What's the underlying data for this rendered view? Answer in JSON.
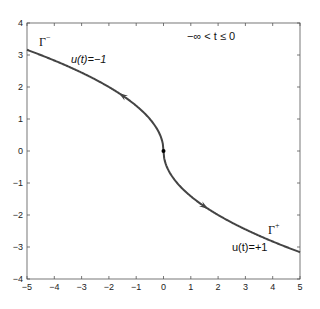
{
  "chart_data": {
    "type": "line",
    "title": "",
    "xlabel": "",
    "ylabel": "",
    "xlim": [
      -5,
      5
    ],
    "ylim": [
      -4,
      4
    ],
    "grid": false,
    "x_ticks": [
      "-5",
      "-4",
      "-3",
      "-2",
      "-1",
      "0",
      "1",
      "2",
      "3",
      "4",
      "5"
    ],
    "y_ticks": [
      "-4",
      "-3",
      "-2",
      "-1",
      "0",
      "1",
      "2",
      "3",
      "4"
    ],
    "series": [
      {
        "name": "Γ⁻ (u(t)=−1)",
        "x": [
          -5,
          -4,
          -3,
          -2,
          -1.5,
          -1,
          -0.5,
          -0.2,
          -0.05,
          0
        ],
        "y": [
          3.16,
          2.83,
          2.45,
          2.0,
          1.73,
          1.41,
          1.0,
          0.63,
          0.32,
          0
        ]
      },
      {
        "name": "Γ⁺ (u(t)=+1)",
        "x": [
          0,
          0.05,
          0.2,
          0.5,
          1,
          1.5,
          2,
          3,
          4,
          5
        ],
        "y": [
          0,
          -0.32,
          -0.63,
          -1.0,
          -1.41,
          -1.73,
          -2.0,
          -2.45,
          -2.83,
          -3.16
        ]
      }
    ],
    "markers": [
      {
        "type": "dot",
        "x": 0,
        "y": 0
      },
      {
        "type": "arrow",
        "x": -1.5,
        "y": 1.73,
        "direction": "up-left"
      },
      {
        "type": "arrow",
        "x": 1.5,
        "y": -1.73,
        "direction": "down-right"
      }
    ],
    "annotations": [
      {
        "text": "−∞ <  t ≤ 0",
        "x": 0.9,
        "y": 3.55
      },
      {
        "text": "Γ⁻",
        "x": -4.5,
        "y": 3.35
      },
      {
        "text": "u(t)=−1",
        "x": -2.7,
        "y": 2.75
      },
      {
        "text": "Γ⁺",
        "x": 3.9,
        "y": -2.5
      },
      {
        "text": "u(t)=+1",
        "x": 2.6,
        "y": -3.0
      }
    ]
  },
  "labels": {
    "time_range": "−∞ <  t ≤ 0",
    "gamma_minus_base": "Γ",
    "gamma_minus_sup": "−",
    "u_minus": "u(t)=−1",
    "gamma_plus_base": "Γ",
    "gamma_plus_sup": "+",
    "u_plus": "u(t)=+1"
  }
}
